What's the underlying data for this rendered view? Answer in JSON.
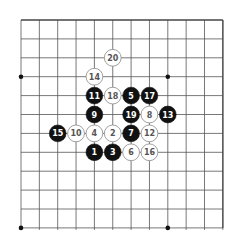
{
  "board": {
    "cols": 12,
    "rows": 12,
    "origin_x": 21,
    "origin_y": 20,
    "spacing_x": 18.35,
    "spacing_y": 18.9,
    "top_edge": true,
    "star_points": [
      [
        0,
        3
      ],
      [
        8,
        3
      ],
      [
        0,
        11
      ],
      [
        8,
        11
      ]
    ],
    "colors": {
      "line": "#555555",
      "edge": "#444444",
      "black_stone": "#111111",
      "white_stone": "#ffffff",
      "white_stone_border": "#888888",
      "black_label": "#ffffff",
      "white_label": "#555555"
    }
  },
  "stones": [
    {
      "n": "1",
      "color": "black",
      "col": 4,
      "row": 7
    },
    {
      "n": "2",
      "color": "white",
      "col": 5,
      "row": 6
    },
    {
      "n": "3",
      "color": "black",
      "col": 5,
      "row": 7
    },
    {
      "n": "4",
      "color": "white",
      "col": 4,
      "row": 6
    },
    {
      "n": "5",
      "color": "black",
      "col": 6,
      "row": 4
    },
    {
      "n": "6",
      "color": "white",
      "col": 6,
      "row": 7
    },
    {
      "n": "7",
      "color": "black",
      "col": 6,
      "row": 6
    },
    {
      "n": "8",
      "color": "white",
      "col": 7,
      "row": 5
    },
    {
      "n": "9",
      "color": "black",
      "col": 4,
      "row": 5
    },
    {
      "n": "10",
      "color": "white",
      "col": 3,
      "row": 6
    },
    {
      "n": "11",
      "color": "black",
      "col": 4,
      "row": 4
    },
    {
      "n": "12",
      "color": "white",
      "col": 7,
      "row": 6
    },
    {
      "n": "13",
      "color": "black",
      "col": 8,
      "row": 5
    },
    {
      "n": "14",
      "color": "white",
      "col": 4,
      "row": 3
    },
    {
      "n": "15",
      "color": "black",
      "col": 2,
      "row": 6
    },
    {
      "n": "16",
      "color": "white",
      "col": 7,
      "row": 7
    },
    {
      "n": "17",
      "color": "black",
      "col": 7,
      "row": 4
    },
    {
      "n": "18",
      "color": "white",
      "col": 5,
      "row": 4
    },
    {
      "n": "19",
      "color": "black",
      "col": 6,
      "row": 5
    },
    {
      "n": "20",
      "color": "white",
      "col": 5,
      "row": 2
    }
  ]
}
